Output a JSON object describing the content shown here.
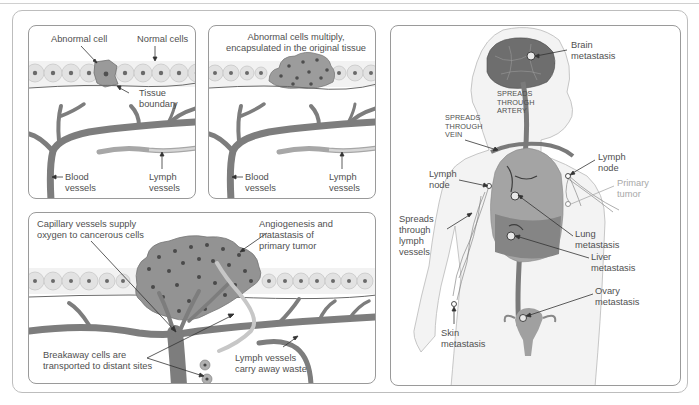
{
  "figure": {
    "panels": {
      "normal_tissue": {
        "labels": {
          "abnormal_cell": "Abnormal cell",
          "normal_cells": "Normal cells",
          "tissue_boundary": "Tissue\nboundary",
          "blood_vessels": "Blood\nvessels",
          "lymph_vessels": "Lymph\nvessels"
        }
      },
      "encapsulated": {
        "labels": {
          "caption": "Abnormal cells multiply,\nencapsulated in the original tissue",
          "blood_vessels": "Blood\nvessels",
          "lymph_vessels": "Lymph\nvessels"
        }
      },
      "angiogenesis": {
        "labels": {
          "capillary": "Capillary vessels supply\noxygen to cancerous cells",
          "angiogenesis": "Angiogenesis and\nmatastasis of\nprimary tumor",
          "breakaway": "Breakaway cells are\ntransported to distant sites",
          "lymph_waste": "Lymph vessels\ncarry away waste"
        }
      },
      "body_metastasis": {
        "labels": {
          "brain": "Brain\nmetastasis",
          "spreads_artery": "SPREADS\nTHROUGH\nARTERY",
          "spreads_vein": "SPREADS\nTHROUGH\nVEIN",
          "lymph_node_right": "Lymph\nnode",
          "primary_tumor": "Primary\ntumor",
          "lymph_node_left": "Lymph\nnode",
          "spreads_lymph": "Spreads\nthrough\nlymph\nvessels",
          "lung": "Lung\nmetastasis",
          "liver": "Liver\nmetastasis",
          "ovary": "Ovary\nmetastasis",
          "skin": "Skin\nmetastasis"
        }
      }
    },
    "colors": {
      "vessel": "#7d7d7d",
      "lymph": "#c4c4c4",
      "cell_fill": "#dcdcdc",
      "nucleus": "#6a6a6a",
      "tumor": "#8f8f8f",
      "body": "#f3f3f3",
      "accent_gray_text": "#a8a8a8"
    }
  }
}
